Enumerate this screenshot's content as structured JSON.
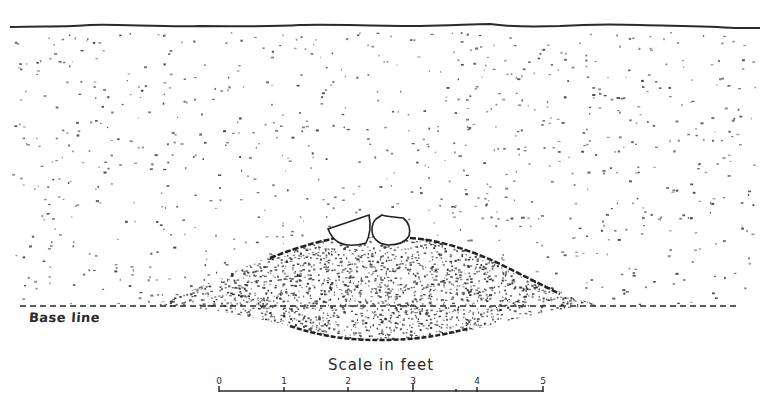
{
  "figure": {
    "type": "stratigraphic-section",
    "colors": {
      "ink": "#2a2a2a",
      "paper": "#ffffff"
    }
  },
  "labels": {
    "baseline": "Base line",
    "scale_title": "Scale in feet"
  },
  "scale": {
    "ticks": [
      "0",
      "1",
      "2",
      "3",
      "4",
      "5"
    ],
    "unit": "feet"
  },
  "features": {
    "top_surface": "ground surface line",
    "fill": "sparsely stippled fill",
    "mound": "densely stippled lens / pit",
    "vessels": [
      "bowl-left",
      "jar-right"
    ]
  }
}
